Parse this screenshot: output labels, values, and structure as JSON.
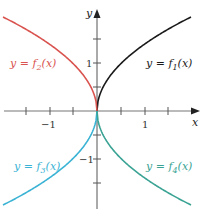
{
  "chart_data": {
    "type": "line",
    "title": "",
    "xlabel": "x",
    "ylabel": "y",
    "xlim": [
      -2.05,
      2.15
    ],
    "ylim": [
      -2.1,
      2.3
    ],
    "grid": false,
    "x_tick_labels": [
      "-1",
      "1"
    ],
    "y_tick_labels": [
      "1",
      "-1"
    ],
    "x_ticks": [
      -1.5,
      -1,
      -0.5,
      0.5,
      1,
      1.5
    ],
    "y_ticks": [
      1.5,
      1,
      0.5,
      -0.5,
      -1,
      -1.5
    ],
    "series": [
      {
        "name": "y = f1(x)",
        "label_main": "y = f",
        "sub": "1",
        "label_end": "(x)",
        "color": "#1a1a1a",
        "quadrant": "I",
        "x": [
          0,
          0.5,
          1,
          1.5,
          2.0
        ],
        "y": [
          0,
          1.0,
          1.41,
          1.73,
          2.0
        ]
      },
      {
        "name": "y = f2(x)",
        "label_main": "y = f",
        "sub": "2",
        "label_end": "(x)",
        "color": "#d9534f",
        "quadrant": "II",
        "x": [
          0,
          -0.5,
          -1,
          -1.5,
          -2.0
        ],
        "y": [
          0,
          1.0,
          1.41,
          1.73,
          2.0
        ]
      },
      {
        "name": "y = f3(x)",
        "label_main": "y = f",
        "sub": "3",
        "label_end": "(x)",
        "color": "#3bb3d4",
        "quadrant": "III",
        "x": [
          0,
          -0.5,
          -1,
          -1.5,
          -2.0
        ],
        "y": [
          0,
          -1.0,
          -1.41,
          -1.73,
          -2.0
        ]
      },
      {
        "name": "y = f4(x)",
        "label_main": "y = f",
        "sub": "4",
        "label_end": "(x)",
        "color": "#3aa394",
        "quadrant": "IV",
        "x": [
          0,
          0.5,
          1,
          1.5,
          2.0
        ],
        "y": [
          0,
          -1.0,
          -1.41,
          -1.73,
          -2.0
        ]
      }
    ]
  },
  "axes": {
    "x_label": "x",
    "y_label": "y",
    "tick_pos_1": "1",
    "tick_neg_1": "−1"
  },
  "labels": {
    "f1": {
      "pre": "y = f",
      "sub": "1",
      "post": "(x)"
    },
    "f2": {
      "pre": "y = f",
      "sub": "2",
      "post": "(x)"
    },
    "f3": {
      "pre": "y = f",
      "sub": "3",
      "post": "(x)"
    },
    "f4": {
      "pre": "y = f",
      "sub": "4",
      "post": "(x)"
    }
  }
}
